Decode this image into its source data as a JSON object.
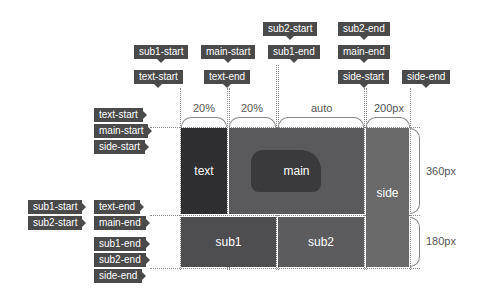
{
  "top_tags": [
    {
      "label": "sub1-start",
      "x": 134,
      "y": 45
    },
    {
      "label": "text-start",
      "x": 134,
      "y": 70
    },
    {
      "label": "main-start",
      "x": 201,
      "y": 45
    },
    {
      "label": "text-end",
      "x": 204,
      "y": 70
    },
    {
      "label": "sub2-start",
      "x": 263,
      "y": 22
    },
    {
      "label": "sub1-end",
      "x": 268,
      "y": 45
    },
    {
      "label": "sub2-end",
      "x": 338,
      "y": 22
    },
    {
      "label": "main-end",
      "x": 338,
      "y": 45
    },
    {
      "label": "side-start",
      "x": 338,
      "y": 70
    },
    {
      "label": "side-end",
      "x": 402,
      "y": 70
    }
  ],
  "left_tags": [
    {
      "label": "text-start",
      "x": 94,
      "y": 108
    },
    {
      "label": "main-start",
      "x": 94,
      "y": 124
    },
    {
      "label": "side-start",
      "x": 94,
      "y": 140
    },
    {
      "label": "sub1-start",
      "x": 28,
      "y": 200
    },
    {
      "label": "sub2-start",
      "x": 28,
      "y": 216
    },
    {
      "label": "text-end",
      "x": 94,
      "y": 200
    },
    {
      "label": "main-end",
      "x": 94,
      "y": 216
    },
    {
      "label": "sub1-end",
      "x": 94,
      "y": 237
    },
    {
      "label": "sub2-end",
      "x": 94,
      "y": 253
    },
    {
      "label": "side-end",
      "x": 94,
      "y": 269
    }
  ],
  "column_sizes": [
    "20%",
    "20%",
    "auto",
    "200px"
  ],
  "row_sizes": [
    "360px",
    "180px"
  ],
  "areas": {
    "text": "text",
    "main": "main",
    "side": "side",
    "sub1": "sub1",
    "sub2": "sub2"
  },
  "colors": {
    "tag_bg": "#4a4a4a",
    "text_area": "#2e2e30",
    "main_area": "#5a5a5c",
    "side_area": "#6a6a6a",
    "sub1_area": "#4e4e50",
    "sub2_area": "#5c5c5e",
    "grid_gap": "#bdbdbd"
  }
}
